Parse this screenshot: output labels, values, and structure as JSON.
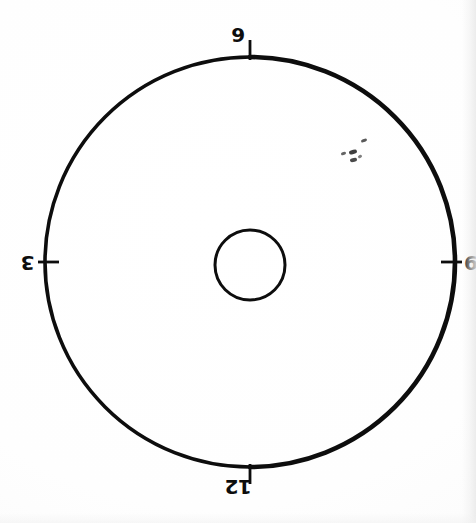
{
  "page": {
    "background_color": "#fdfdfd",
    "ink_color": "#0d0d0d",
    "width": 476,
    "height": 523
  },
  "diagram": {
    "type": "circle-with-quadrant-ticks",
    "outer_circle": {
      "name": "outer-circle",
      "center_x": 250,
      "center_y": 262,
      "radius": 205,
      "stroke_width": 4,
      "stroke_color": "#0d0d0d"
    },
    "inner_circle": {
      "name": "inner-circle",
      "center_x": 250,
      "center_y": 265,
      "radius": 35,
      "stroke_width": 3,
      "stroke_color": "#0d0d0d"
    },
    "ticks": [
      {
        "position": "top",
        "angle_deg": 90,
        "length": 22,
        "stroke_width": 3
      },
      {
        "position": "right",
        "angle_deg": 0,
        "length": 22,
        "stroke_width": 3
      },
      {
        "position": "bottom",
        "angle_deg": 270,
        "length": 22,
        "stroke_width": 3
      },
      {
        "position": "left",
        "angle_deg": 180,
        "length": 22,
        "stroke_width": 3
      }
    ],
    "labels": {
      "top": "9",
      "right": "6",
      "bottom": "12",
      "left": "3"
    },
    "label_orientation": {
      "top": "upright",
      "right": "upright",
      "bottom": "rotated-180",
      "left": "rotated-180"
    },
    "artifacts": {
      "name": "scan-speckles",
      "description": "faint ink specks in upper-right interior",
      "marks": [
        {
          "x": 361,
          "y": 139,
          "w": 6,
          "h": 3,
          "rot": -22,
          "opacity": 0.78
        },
        {
          "x": 349,
          "y": 150,
          "w": 8,
          "h": 4,
          "rot": -18,
          "opacity": 0.9
        },
        {
          "x": 341,
          "y": 152,
          "w": 5,
          "h": 3,
          "rot": -20,
          "opacity": 0.72
        },
        {
          "x": 350,
          "y": 158,
          "w": 7,
          "h": 4,
          "rot": -12,
          "opacity": 0.85
        },
        {
          "x": 358,
          "y": 155,
          "w": 4,
          "h": 3,
          "rot": -30,
          "opacity": 0.6
        }
      ]
    }
  }
}
